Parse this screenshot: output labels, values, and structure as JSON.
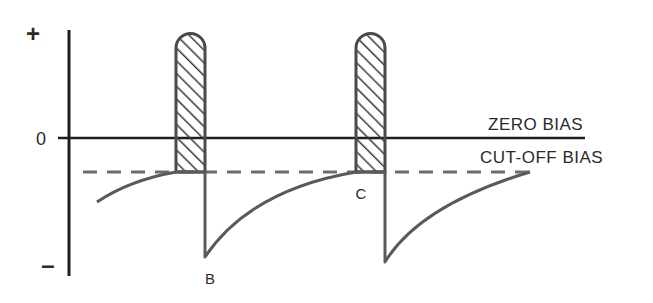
{
  "diagram": {
    "type": "grid-bias waveform (class C operation)",
    "colors": {
      "axis": "#1e1e1e",
      "waveform": "#5a5a5a",
      "dashed": "#6e6e6e",
      "hatch": "#3a3a3a"
    },
    "axis_labels": {
      "plus": "+",
      "zero": "0",
      "minus": "–"
    },
    "reference_lines": [
      {
        "id": "zero-bias",
        "label": "ZERO BIAS",
        "style": "solid"
      },
      {
        "id": "cut-off-bias",
        "label": "CUT-OFF BIAS",
        "style": "dashed"
      }
    ],
    "points": [
      {
        "id": "B",
        "label": "B"
      },
      {
        "id": "C",
        "label": "C"
      }
    ],
    "pulses": [
      {
        "id": "pulse-1",
        "fill": "hatched"
      },
      {
        "id": "pulse-2",
        "fill": "hatched"
      }
    ]
  }
}
